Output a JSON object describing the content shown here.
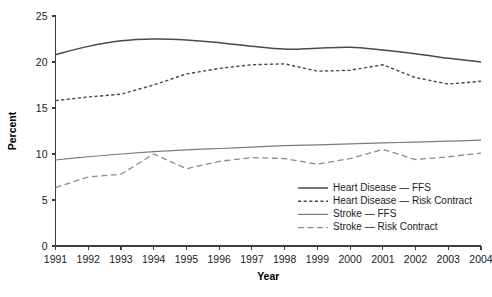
{
  "chart_data": {
    "type": "line",
    "title": "",
    "xlabel": "Year",
    "ylabel": "Percent",
    "xlim": [
      1991,
      2004
    ],
    "ylim": [
      0,
      25
    ],
    "ytick_step": 5,
    "yticks": [
      "0",
      "5",
      "10",
      "15",
      "20",
      "25"
    ],
    "grid": false,
    "legend_position": "inside-bottom-right",
    "x": [
      1991,
      1992,
      1993,
      1994,
      1995,
      1996,
      1997,
      1998,
      1999,
      2000,
      2001,
      2002,
      2003,
      2004
    ],
    "categories": [
      "1991",
      "1992",
      "1993",
      "1994",
      "1995",
      "1996",
      "1997",
      "1998",
      "1999",
      "2000",
      "2001",
      "2002",
      "2003",
      "2004"
    ],
    "series": [
      {
        "name": "Heart Disease — FFS",
        "style": "solid",
        "color": "#4a4a4a",
        "width": 1.5,
        "dash": "none",
        "smooth": true,
        "values": [
          20.8,
          21.7,
          22.3,
          22.5,
          22.4,
          22.1,
          21.7,
          21.4,
          21.5,
          21.6,
          21.3,
          20.9,
          20.4,
          20.0
        ]
      },
      {
        "name": "Heart Disease — Risk Contract",
        "style": "dashed",
        "color": "#4a4a4a",
        "width": 1.4,
        "dash": "3.2 2.4",
        "smooth": false,
        "values": [
          15.8,
          16.2,
          16.5,
          17.5,
          18.7,
          19.3,
          19.7,
          19.8,
          19.0,
          19.1,
          19.7,
          18.3,
          17.6,
          17.9
        ]
      },
      {
        "name": "Stroke — FFS",
        "style": "solid",
        "color": "#7b7b7b",
        "width": 1.2,
        "dash": "none",
        "smooth": true,
        "values": [
          9.35,
          9.7,
          10.0,
          10.25,
          10.45,
          10.6,
          10.75,
          10.9,
          11.0,
          11.1,
          11.2,
          11.3,
          11.4,
          11.5
        ]
      },
      {
        "name": "Stroke — Risk Contract",
        "style": "long-dashed",
        "color": "#8a8a8a",
        "width": 1.3,
        "dash": "6 3.5",
        "smooth": false,
        "values": [
          6.35,
          7.5,
          7.8,
          10.0,
          8.4,
          9.2,
          9.6,
          9.5,
          8.9,
          9.5,
          10.5,
          9.4,
          9.7,
          10.1
        ]
      }
    ],
    "legend": [
      {
        "label": "Heart Disease — FFS",
        "style": "solid",
        "color": "#4a4a4a",
        "width": 1.5,
        "dash": "none"
      },
      {
        "label": "Heart Disease — Risk Contract",
        "style": "dashed",
        "color": "#4a4a4a",
        "width": 1.4,
        "dash": "3.2 2.4"
      },
      {
        "label": "Stroke — FFS",
        "style": "solid",
        "color": "#7b7b7b",
        "width": 1.2,
        "dash": "none"
      },
      {
        "label": "Stroke — Risk Contract",
        "style": "long-dashed",
        "color": "#8a8a8a",
        "width": 1.3,
        "dash": "6 3.5"
      }
    ]
  },
  "colors": {
    "background": "#ffffff",
    "axis": "#3d3d3d",
    "text": "#1a1a1a",
    "heart_ffs": "#4a4a4a",
    "heart_risk": "#4a4a4a",
    "stroke_ffs": "#7b7b7b",
    "stroke_risk": "#8a8a8a"
  }
}
